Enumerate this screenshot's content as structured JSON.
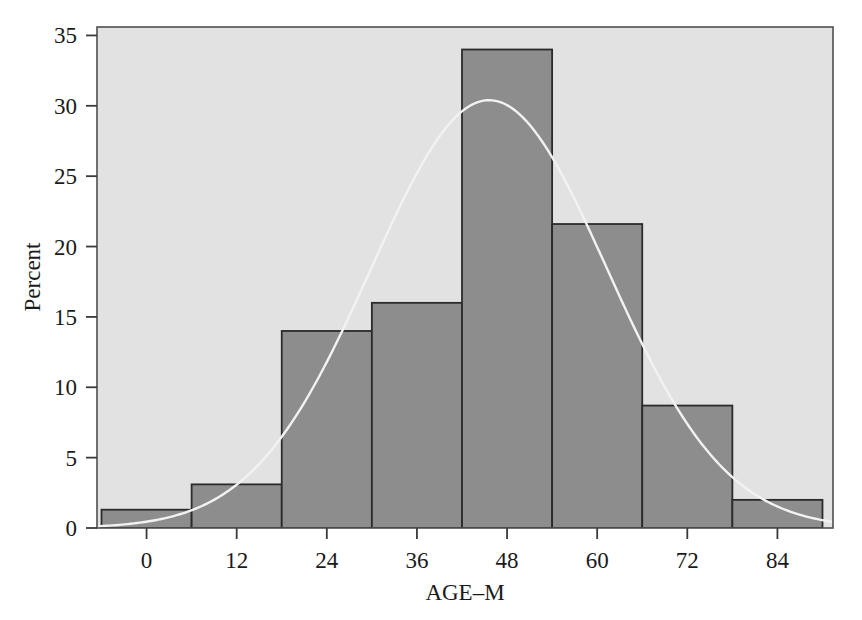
{
  "chart_data": {
    "type": "bar",
    "title": "",
    "subtitle": "",
    "xlabel": "AGE–M",
    "ylabel": "Percent",
    "xlim": [
      -6.6,
      91.4
    ],
    "ylim": [
      0,
      35.6
    ],
    "grid": false,
    "legend": null,
    "bin_width": 12,
    "bin_edges": [
      -6,
      6,
      18,
      30,
      42,
      54,
      66,
      78,
      90
    ],
    "bin_midpoints": [
      0,
      12,
      24,
      36,
      48,
      60,
      72,
      84
    ],
    "categories": [
      "0",
      "12",
      "24",
      "36",
      "48",
      "60",
      "72",
      "84"
    ],
    "values": [
      1.3,
      3.1,
      14.0,
      16.0,
      34.0,
      21.6,
      8.7,
      2.0
    ],
    "xticks": [
      0,
      12,
      24,
      36,
      48,
      60,
      72,
      84
    ],
    "xtick_labels": [
      "0",
      "12",
      "24",
      "36",
      "48",
      "60",
      "72",
      "84"
    ],
    "yticks": [
      0,
      5,
      10,
      15,
      20,
      25,
      30,
      35
    ],
    "ytick_labels": [
      "0",
      "5",
      "10",
      "15",
      "20",
      "25",
      "30",
      "35"
    ],
    "overlay": {
      "type": "line",
      "name": "normal-curve",
      "peak_x": 45.6,
      "peak_y": 30.4,
      "mean": 45.6,
      "sigma": 15.7,
      "color": "#f2f2f2"
    },
    "colors": {
      "plot_background": "#e2e2e2",
      "bar_fill": "#8d8d8d",
      "bar_edge": "#2b2b2b",
      "frame": "#4a4a4a",
      "axis_text": "#1a1a1a",
      "page_background": "#ffffff"
    }
  },
  "axes": {
    "x_axis_label": "AGE–M",
    "y_axis_label": "Percent"
  }
}
